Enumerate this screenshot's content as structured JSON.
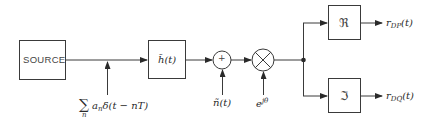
{
  "diagram": {
    "blocks": {
      "source": {
        "label": "SOURCE"
      },
      "filter": {
        "label": "h̃(t)"
      },
      "real_part": {
        "label": "ℜ"
      },
      "imag_part": {
        "label": "ℑ"
      }
    },
    "operators": {
      "adder": {
        "symbol": "+"
      },
      "multiplier": {
        "symbol": "×"
      }
    },
    "inputs": {
      "impulse_train": {
        "sum": "∑",
        "sum_index": "n",
        "expr": "a",
        "expr_sub": "n",
        "expr_rest": "δ(t − nT)"
      },
      "noise": {
        "label": "ñ(t)"
      },
      "phase": {
        "base": "e",
        "exp": "jθ"
      }
    },
    "outputs": {
      "dp": {
        "base": "r",
        "sub": "DP",
        "arg": "(t)"
      },
      "dq": {
        "base": "r",
        "sub": "DQ",
        "arg": "(t)"
      }
    },
    "colors": {
      "stroke": "#3a3a3a",
      "text": "#2a2a2a",
      "background": "#ffffff"
    }
  }
}
